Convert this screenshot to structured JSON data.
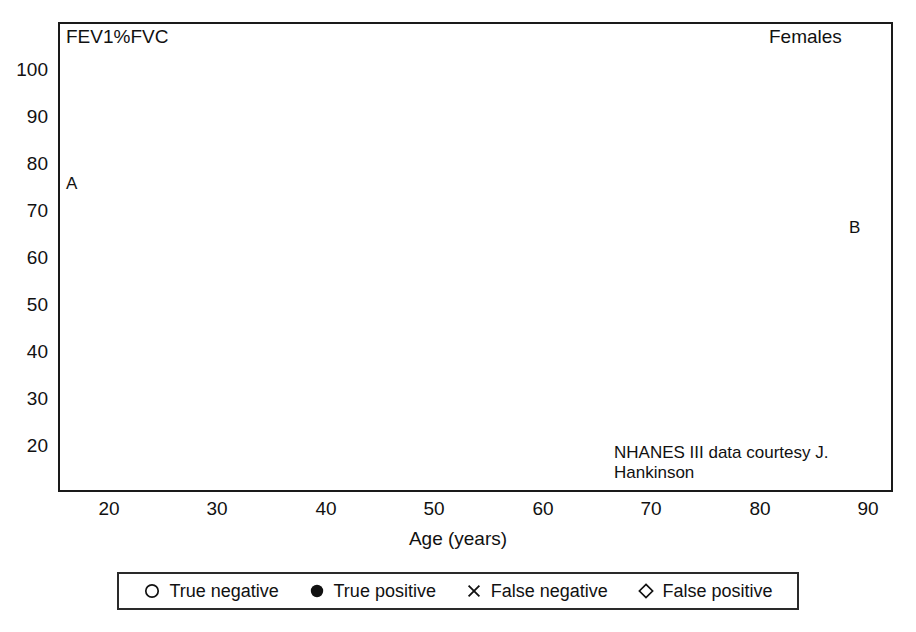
{
  "chart_data": {
    "type": "scatter",
    "title": "FEV1%FVC",
    "group_label": "Females",
    "credit": "NHANES III data courtesy J. Hankinson",
    "xlabel": "Age (years)",
    "ylabel": "FEV1%FVC",
    "xlim": [
      15,
      92
    ],
    "ylim": [
      15,
      104
    ],
    "xticks": [
      20,
      30,
      40,
      50,
      60,
      70,
      80,
      90
    ],
    "yticks": [
      20,
      30,
      40,
      50,
      60,
      70,
      80,
      90,
      100
    ],
    "grid": true,
    "legend_position": "below-axes",
    "legend": [
      {
        "key": "true_negative",
        "label": "True negative",
        "marker": "open-circle"
      },
      {
        "key": "true_positive",
        "label": "True positive",
        "marker": "filled-circle"
      },
      {
        "key": "false_negative",
        "label": "False negative",
        "marker": "cross"
      },
      {
        "key": "false_positive",
        "label": "False positive",
        "marker": "open-diamond"
      }
    ],
    "reference_lines": [
      {
        "id": "A",
        "label": "A",
        "description": "Age-dependent lower limit of normal (LLN) regression line",
        "type": "sloped",
        "x_start": 15,
        "y_start": 80.0,
        "x_end": 92,
        "y_end": 57.2
      },
      {
        "id": "B",
        "label": "B",
        "description": "Fixed 70% FEV1/FVC cut-point",
        "type": "horizontal",
        "y": 70.0
      }
    ],
    "annotations": [
      {
        "text": "Females",
        "x_px": 769,
        "y_px": 26
      },
      {
        "text": "NHANES III data courtesy J. Hankinson",
        "x_px": 614,
        "y_px": 443
      },
      {
        "text": "A",
        "x_px": 66,
        "y_px": 174
      },
      {
        "text": "B",
        "x_px": 849,
        "y_px": 218
      }
    ],
    "series": [
      {
        "name": "True negative",
        "marker": "open-circle",
        "region": "above line A",
        "count_approx": 3100,
        "description": "Dense vertical columns of open circles at each integer age from 20 to 90, spanning FEV1%FVC from line A up to 100, densest between 78 and 92."
      },
      {
        "name": "False negative",
        "marker": "cross",
        "region": "between line A and line B (below A, above 70)",
        "count_approx": 260,
        "description": "Crosses occupy the wedge between the sloped LLN line and the 70% line where line A lies above 70, i.e. ages 20 to about 58."
      },
      {
        "name": "False positive",
        "marker": "open-diamond",
        "region": "between line B and line A (below 70, above A)",
        "count_approx": 300,
        "description": "Diamonds occupy the wedge where the 70% line lies above the sloped LLN line, i.e. ages about 58 to 91."
      },
      {
        "name": "True positive",
        "marker": "filled-circle",
        "region": "below both lines",
        "count_approx": 430,
        "description": "Scattered filled circles from the lower envelope down to about 22, sparse at young ages and increasingly dense after age 60."
      }
    ]
  },
  "axes": {
    "x_tick_labels": [
      "20",
      "30",
      "40",
      "50",
      "60",
      "70",
      "80",
      "90"
    ],
    "y_tick_labels": [
      "100",
      "90",
      "80",
      "70",
      "60",
      "50",
      "40",
      "30",
      "20"
    ],
    "x_axis_title": "Age (years)",
    "y_axis_title": "FEV1%FVC"
  },
  "colors": {
    "frame": "#1a1a1a",
    "grid": "#c8c8c8",
    "marker": "#111111",
    "reference_line": "#000000",
    "background": "#ffffff"
  }
}
